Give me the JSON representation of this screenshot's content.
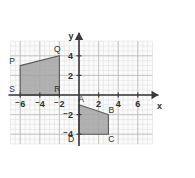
{
  "figure": {
    "name": "coordinate-plane-two-quadrilaterals",
    "axis_labels": {
      "x": "x",
      "y": "y"
    },
    "grid": {
      "x_min": -7,
      "x_max": 7.5,
      "y_min": -5,
      "y_max": 5.5,
      "major_step": 2,
      "minor_step": 0.5,
      "unit_px": 9.8,
      "origin_px": {
        "x": 79,
        "y": 95
      },
      "major_color": "#bfbfbf",
      "minor_color": "#e0e0e0",
      "background": "#fbfbfb"
    },
    "axes": {
      "color": "#3a3a3a",
      "x_tick_labels": [
        "⁻6",
        "⁻4",
        "⁻2",
        "2",
        "4",
        "6"
      ],
      "x_tick_values": [
        -6,
        -4,
        -2,
        2,
        4,
        6
      ],
      "y_tick_labels": [
        "4",
        "2",
        "⁻2",
        "⁻4"
      ],
      "y_tick_values": [
        4,
        2,
        -2,
        -4
      ]
    },
    "shapes": [
      {
        "id": "pqrs",
        "name": "quadrilateral-pqrs",
        "fill": "#a3a3a3",
        "stroke": "#5a5a5a",
        "vertices": [
          {
            "label": "P",
            "x": -6,
            "y": 3
          },
          {
            "label": "Q",
            "x": -2,
            "y": 4
          },
          {
            "label": "R",
            "x": -2,
            "y": 0
          },
          {
            "label": "S",
            "x": -6,
            "y": 0
          }
        ]
      },
      {
        "id": "abcd",
        "name": "quadrilateral-abcd",
        "fill": "#a3a3a3",
        "stroke": "#5a5a5a",
        "vertices": [
          {
            "label": "A",
            "x": 0,
            "y": -1
          },
          {
            "label": "B",
            "x": 3,
            "y": -2
          },
          {
            "label": "C",
            "x": 3,
            "y": -4
          },
          {
            "label": "D",
            "x": 0,
            "y": -4
          }
        ]
      }
    ],
    "vertex_label_offsets": {
      "P": {
        "dx": -8,
        "dy": -2
      },
      "Q": {
        "dx": -2,
        "dy": -4
      },
      "R": {
        "dx": -2,
        "dy": -3
      },
      "S": {
        "dx": -8,
        "dy": -3
      },
      "A": {
        "dx": 2,
        "dy": -3
      },
      "B": {
        "dx": 3,
        "dy": -2
      },
      "C": {
        "dx": 3,
        "dy": 8
      },
      "D": {
        "dx": -8,
        "dy": 8
      }
    }
  }
}
